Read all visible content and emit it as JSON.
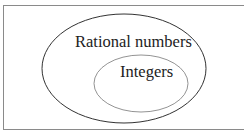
{
  "diagram": {
    "type": "venn",
    "outer_set": {
      "label": "Rational numbers"
    },
    "inner_set": {
      "label": "Integers"
    },
    "relationship": "Integers is a subset of Rational numbers"
  },
  "colors": {
    "background": "#ffffff",
    "border": "#8a8a8a",
    "outer_ellipse_stroke": "#333333",
    "inner_ellipse_stroke": "#777777",
    "text": "#222222"
  }
}
